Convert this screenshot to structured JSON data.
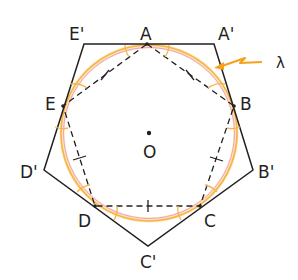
{
  "diagram": {
    "center": {
      "label": "O",
      "x": 149,
      "y": 133
    },
    "circle": {
      "radius": 87,
      "color": "#f7b44a",
      "inner_color": "#e9a2c8"
    },
    "outer_pentagon": [
      {
        "label": "E'",
        "x": 84,
        "y": 44
      },
      {
        "label": "A'",
        "x": 214,
        "y": 44
      },
      {
        "label": "B'",
        "x": 253,
        "y": 170
      },
      {
        "label": "C'",
        "x": 148,
        "y": 246
      },
      {
        "label": "D'",
        "x": 44,
        "y": 170
      }
    ],
    "inner_pentagon": [
      {
        "label": "A",
        "x": 147,
        "y": 44
      },
      {
        "label": "B",
        "x": 234,
        "y": 106
      },
      {
        "label": "C",
        "x": 200,
        "y": 206
      },
      {
        "label": "D",
        "x": 95,
        "y": 206
      },
      {
        "label": "E",
        "x": 63,
        "y": 106
      }
    ],
    "annotation": {
      "label": "λ",
      "color": "#f7a21b"
    },
    "colors": {
      "line": "#231f20",
      "dashed": "#231f20",
      "arc": "#f7b44a"
    }
  },
  "labels": {
    "A": "A",
    "B": "B",
    "C": "C",
    "D": "D",
    "E": "E",
    "Ap": "A'",
    "Bp": "B'",
    "Cp": "C'",
    "Dp": "D'",
    "Ep": "E'",
    "O": "O",
    "lambda": "λ"
  }
}
